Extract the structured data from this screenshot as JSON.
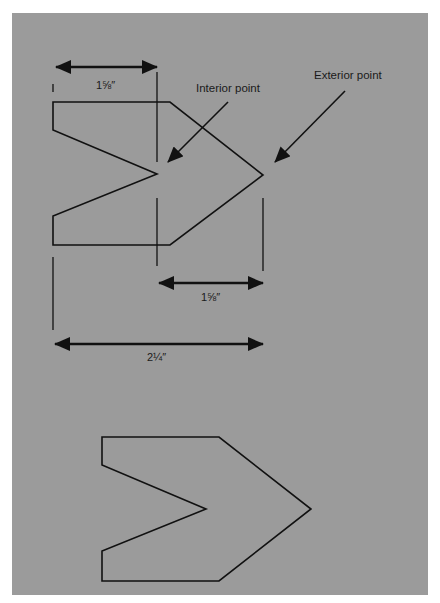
{
  "figure": {
    "background_color": "#9b9b9b",
    "line_color": "#111111",
    "annotations": {
      "interior_point": "Interior point",
      "exterior_point": "Exterior point"
    },
    "dimensions": {
      "top_width": "1⅝″",
      "middle_width": "1⅝″",
      "total_width": "2¼″"
    },
    "shapes": [
      {
        "name": "dimensioned-chevron",
        "points": [
          [
            53,
            102
          ],
          [
            170,
            102
          ],
          [
            263,
            175
          ],
          [
            170,
            245
          ],
          [
            53,
            245
          ],
          [
            53,
            216
          ],
          [
            157,
            174
          ],
          [
            53,
            130
          ]
        ]
      },
      {
        "name": "plain-chevron",
        "points": [
          [
            102,
            437
          ],
          [
            219,
            437
          ],
          [
            311,
            509
          ],
          [
            219,
            581
          ],
          [
            102,
            581
          ],
          [
            102,
            551
          ],
          [
            206,
            509
          ],
          [
            102,
            465
          ]
        ]
      }
    ],
    "caption": ""
  }
}
